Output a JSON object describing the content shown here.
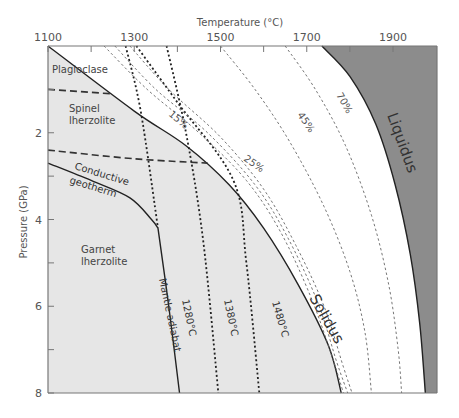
{
  "chart_data": {
    "type": "line",
    "title": "",
    "xlabel": "Temperature (°C)",
    "ylabel": "Pressure (GPa)",
    "xlim": [
      1100,
      1995
    ],
    "ylim": [
      8,
      0
    ],
    "x_ticks": [
      1100,
      1300,
      1500,
      1700,
      1900
    ],
    "x_minor_ticks": [
      1200,
      1400,
      1600,
      1800
    ],
    "y_ticks": [
      2,
      4,
      6,
      8
    ],
    "y_minor_ticks": [
      1,
      3,
      5,
      7
    ],
    "x_axis_position": "top",
    "grid": false,
    "regions": [
      {
        "name": "Plagioclase",
        "label": "Plagioclase",
        "fill": "#e6e6e6"
      },
      {
        "name": "Spinel lherzolite",
        "label_line1": "Spinel",
        "label_line2": "lherzolite",
        "fill": "#e6e6e6"
      },
      {
        "name": "Garnet lherzolite",
        "label_line1": "Garnet",
        "label_line2": "lherzolite",
        "fill": "#e6e6e6"
      },
      {
        "name": "Liquid",
        "fill": "#8c8c8c"
      }
    ],
    "series": [
      {
        "name": "Solidus",
        "style": "solid",
        "points": [
          [
            1100,
            0
          ],
          [
            1300,
            1.5
          ],
          [
            1420,
            2.3
          ],
          [
            1520,
            3.2
          ],
          [
            1600,
            4.2
          ],
          [
            1680,
            5.5
          ],
          [
            1750,
            6.9
          ],
          [
            1780,
            8
          ]
        ]
      },
      {
        "name": "Liquidus",
        "style": "solid",
        "points": [
          [
            1735,
            0
          ],
          [
            1800,
            0.7
          ],
          [
            1860,
            1.8
          ],
          [
            1905,
            3.2
          ],
          [
            1940,
            4.8
          ],
          [
            1962,
            6.4
          ],
          [
            1975,
            8
          ]
        ]
      },
      {
        "name": "Conductive geotherm",
        "style": "solid",
        "points": [
          [
            1100,
            2.7
          ],
          [
            1200,
            3.1
          ],
          [
            1290,
            3.5
          ],
          [
            1340,
            4.0
          ],
          [
            1355,
            4.2
          ]
        ]
      },
      {
        "name": "Mantle adiabat 1280°C",
        "style": "solid",
        "points": [
          [
            1355,
            4.2
          ],
          [
            1380,
            6
          ],
          [
            1405,
            8
          ]
        ]
      },
      {
        "name": "Mantle adiabat 1280°C (dotted upper)",
        "style": "dotted",
        "points": [
          [
            1280,
            0
          ],
          [
            1315,
            1.5
          ],
          [
            1355,
            4.2
          ]
        ]
      },
      {
        "name": "Mantle adiabat 1380°C",
        "style": "dotted",
        "points": [
          [
            1375,
            0
          ],
          [
            1420,
            2
          ],
          [
            1460,
            4.5
          ],
          [
            1495,
            8
          ]
        ]
      },
      {
        "name": "Mantle adiabat 1480°C",
        "style": "dotted",
        "points": [
          [
            1305,
            0
          ],
          [
            1400,
            1.3
          ],
          [
            1530,
            3.1
          ],
          [
            1560,
            5
          ],
          [
            1590,
            8
          ]
        ]
      },
      {
        "name": "Plagioclase-spinel boundary",
        "style": "dashed",
        "points": [
          [
            1100,
            1.0
          ],
          [
            1245,
            1.1
          ]
        ]
      },
      {
        "name": "Spinel-garnet boundary",
        "style": "dashed",
        "points": [
          [
            1100,
            2.4
          ],
          [
            1300,
            2.6
          ],
          [
            1470,
            2.7
          ]
        ]
      },
      {
        "name": "15% melt",
        "style": "fine-dashed",
        "points": [
          [
            1230,
            0
          ],
          [
            1330,
            1.0
          ],
          [
            1450,
            2.0
          ],
          [
            1560,
            3.1
          ],
          [
            1640,
            4.3
          ],
          [
            1710,
            5.8
          ],
          [
            1760,
            7.2
          ],
          [
            1785,
            8
          ]
        ]
      },
      {
        "name": "25% melt (a)",
        "style": "fine-dashed",
        "points": [
          [
            1255,
            0
          ],
          [
            1350,
            1.0
          ],
          [
            1470,
            2.0
          ],
          [
            1580,
            3.2
          ],
          [
            1655,
            4.4
          ],
          [
            1725,
            5.9
          ],
          [
            1770,
            7.3
          ],
          [
            1795,
            8
          ]
        ]
      },
      {
        "name": "25% melt (b)",
        "style": "fine-dashed",
        "points": [
          [
            1290,
            0
          ],
          [
            1380,
            1.0
          ],
          [
            1500,
            2.1
          ],
          [
            1600,
            3.3
          ],
          [
            1675,
            4.6
          ],
          [
            1740,
            6.0
          ],
          [
            1785,
            7.4
          ],
          [
            1805,
            8
          ]
        ]
      },
      {
        "name": "45% melt",
        "style": "fine-dashed",
        "points": [
          [
            1500,
            0
          ],
          [
            1580,
            1.0
          ],
          [
            1660,
            2.2
          ],
          [
            1740,
            3.7
          ],
          [
            1800,
            5.2
          ],
          [
            1835,
            6.6
          ],
          [
            1850,
            8
          ]
        ]
      },
      {
        "name": "70% melt",
        "style": "fine-dashed",
        "points": [
          [
            1650,
            0
          ],
          [
            1720,
            1.0
          ],
          [
            1790,
            2.3
          ],
          [
            1850,
            3.9
          ],
          [
            1890,
            5.5
          ],
          [
            1912,
            7
          ],
          [
            1920,
            8
          ]
        ]
      }
    ],
    "annotations": {
      "plagioclase": "Plagioclase",
      "spinel_1": "Spinel",
      "spinel_2": "lherzolite",
      "garnet_1": "Garnet",
      "garnet_2": "lherzolite",
      "conductive_1": "Conductive",
      "conductive_2": "geotherm",
      "mantle_adiabat": "Mantle adiabat",
      "t1280": "1280°C",
      "t1380": "1380°C",
      "t1480": "1480°C",
      "solidus": "Solidus",
      "liquidus": "Liquidus",
      "p15": "15%",
      "p25": "25%",
      "p45": "45%",
      "p70": "70%"
    }
  }
}
